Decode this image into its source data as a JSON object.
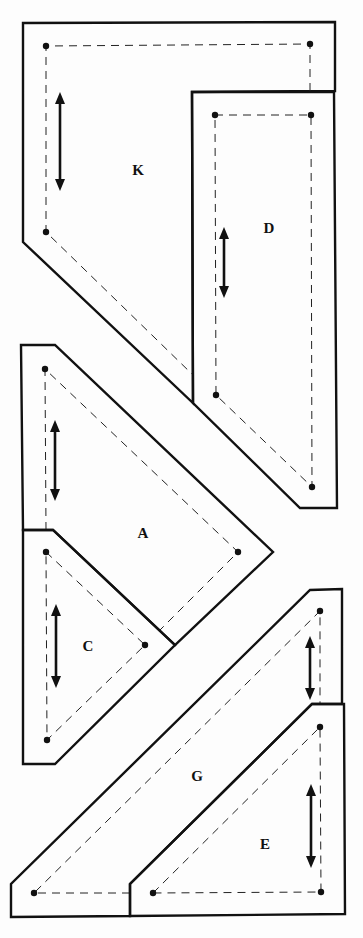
{
  "diagram": {
    "type": "quilt-pattern-templates",
    "pieces": [
      {
        "id": "K",
        "label": "K",
        "label_pos": [
          138,
          170
        ],
        "grain": "vertical"
      },
      {
        "id": "D",
        "label": "D",
        "label_pos": [
          269,
          228
        ],
        "grain": "vertical"
      },
      {
        "id": "A",
        "label": "A",
        "label_pos": [
          143,
          533
        ],
        "grain": "vertical"
      },
      {
        "id": "C",
        "label": "C",
        "label_pos": [
          88,
          646
        ],
        "grain": "vertical"
      },
      {
        "id": "G",
        "label": "G",
        "label_pos": [
          197,
          776
        ],
        "grain": "vertical"
      },
      {
        "id": "E",
        "label": "E",
        "label_pos": [
          265,
          844
        ],
        "grain": "vertical"
      }
    ],
    "legend": {
      "solid_line": "cutting line",
      "dashed_line": "seam line",
      "double_arrow": "grain line",
      "dot": "seam corner point"
    }
  }
}
